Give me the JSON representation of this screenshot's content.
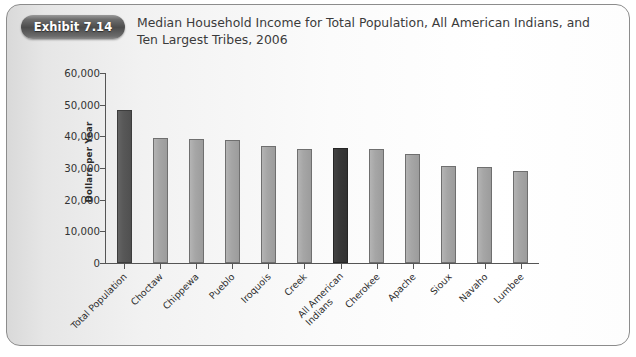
{
  "exhibit": {
    "badge_label": "Exhibit 7.14",
    "title": "Median Household Income for Total Population, All American Indians, and Ten Largest Tribes, 2006"
  },
  "chart_data": {
    "type": "bar",
    "title": "Median Household Income for Total Population, All American Indians, and Ten Largest Tribes, 2006",
    "xlabel": "",
    "ylabel": "Dollars per Year",
    "ylim": [
      0,
      60000
    ],
    "ytick_labels": [
      "60,000",
      "50,000",
      "40,000",
      "30,000",
      "20,000",
      "10,000",
      "0"
    ],
    "ytick_values": [
      60000,
      50000,
      40000,
      30000,
      20000,
      10000,
      0
    ],
    "grid": false,
    "legend": "none",
    "categories": [
      "Total Population",
      "Choctaw",
      "Chippewa",
      "Pueblo",
      "Iroquois",
      "Creek",
      "All American Indians",
      "Cherokee",
      "Apache",
      "Sioux",
      "Navaho",
      "Lumbee"
    ],
    "values": [
      48400,
      39500,
      39200,
      38800,
      37000,
      36100,
      36200,
      36000,
      34300,
      30600,
      30200,
      28900
    ],
    "bar_styles": [
      "dark",
      "light",
      "light",
      "light",
      "light",
      "light",
      "darkest",
      "light",
      "light",
      "light",
      "light",
      "light"
    ],
    "colors": {
      "dark_bar": "#585858",
      "darkest_bar": "#393939",
      "light_bar": "#a6a6a6",
      "axis": "#555555",
      "badge": "#4c4c4c",
      "panel_border": "#8c8c8c"
    }
  }
}
